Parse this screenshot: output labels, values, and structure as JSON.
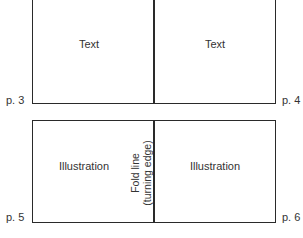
{
  "diagram": {
    "top_spread": {
      "left_panel": {
        "label": "Text",
        "page": "p. 3"
      },
      "right_panel": {
        "label": "Text",
        "page": "p. 4"
      }
    },
    "bottom_spread": {
      "left_panel": {
        "label": "Illustration",
        "page": "p. 5"
      },
      "right_panel": {
        "label": "Illustration",
        "page": "p. 6"
      },
      "fold_label_line1": "Fold line",
      "fold_label_line2": "(turning edge)"
    },
    "colors": {
      "line": "#2a2a2a",
      "text": "#333333",
      "background": "#ffffff"
    }
  }
}
